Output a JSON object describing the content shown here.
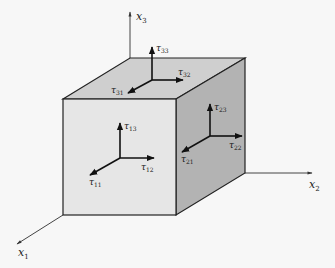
{
  "figure": {
    "background": "#f7f7f7",
    "colors": {
      "front_face": "#e6e6e6",
      "top_face": "#cfcfcf",
      "side_face": "#b5b5b5",
      "edge": "#222222",
      "axis": "#444444",
      "arrow": "#111111"
    },
    "axes": [
      {
        "id": "x1",
        "base": "x",
        "sub": "1"
      },
      {
        "id": "x2",
        "base": "x",
        "sub": "2"
      },
      {
        "id": "x3",
        "base": "x",
        "sub": "3"
      }
    ],
    "faces": {
      "top": {
        "normal": "x3",
        "stresses": [
          {
            "base": "τ",
            "sub": "33",
            "direction": "x3"
          },
          {
            "base": "τ",
            "sub": "32",
            "direction": "x2"
          },
          {
            "base": "τ",
            "sub": "31",
            "direction": "x1"
          }
        ]
      },
      "side": {
        "normal": "x2",
        "stresses": [
          {
            "base": "τ",
            "sub": "23",
            "direction": "x3"
          },
          {
            "base": "τ",
            "sub": "22",
            "direction": "x2"
          },
          {
            "base": "τ",
            "sub": "21",
            "direction": "x1"
          }
        ]
      },
      "front": {
        "normal": "x1",
        "stresses": [
          {
            "base": "τ",
            "sub": "13",
            "direction": "x3"
          },
          {
            "base": "τ",
            "sub": "12",
            "direction": "x2"
          },
          {
            "base": "τ",
            "sub": "11",
            "direction": "x1"
          }
        ]
      }
    }
  }
}
